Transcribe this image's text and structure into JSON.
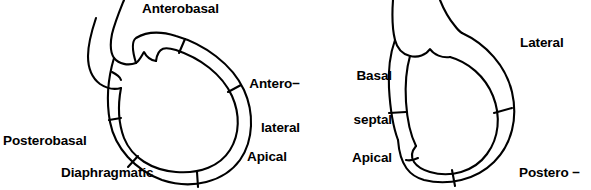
{
  "figure": {
    "type": "anatomical-diagram",
    "stroke_color": "#000000",
    "background_color": "#ffffff",
    "panels": [
      {
        "id": "left-panel",
        "name": "anterior-view-ventriculogram",
        "segments": [
          "Anterobasal",
          "Antero−lateral",
          "Apical",
          "Diaphragmatic",
          "Posterobasal"
        ]
      },
      {
        "id": "right-panel",
        "name": "septal-view-ventriculogram",
        "segments": [
          "Basal septal",
          "Apical septal",
          "Lateral",
          "Postero−lateral"
        ]
      }
    ]
  },
  "labels": {
    "anterobasal": "Anterobasal",
    "anterolateral_line1": "Antero−",
    "anterolateral_line2": "lateral",
    "posterobasal": "Posterobasal",
    "apical": "Apical",
    "diaphragmatic": "Diaphragmatic",
    "basal_septal_line1": "Basal",
    "basal_septal_line2": "septal",
    "apical_septal_line1": "Apical",
    "apical_septal_line2": "septal",
    "lateral": "Lateral",
    "postero_lateral_line1": "Postero −",
    "postero_lateral_line2": "lateral"
  }
}
